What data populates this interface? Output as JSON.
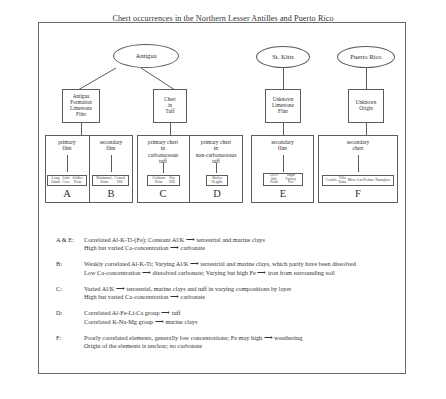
{
  "title": "Chert occurrences in the Northern Lesser Antilles and Puerto Rico",
  "islands": [
    {
      "id": "antigua",
      "label": "Antigua"
    },
    {
      "id": "st-kitts",
      "label": "St. Kitts"
    },
    {
      "id": "puerto-rico",
      "label": "Puerto Rico"
    }
  ],
  "formations": [
    {
      "id": "antigua-formation",
      "label": "Antigua\nFormation\nLimestone\nFlint"
    },
    {
      "id": "chert-in-tuff",
      "label": "Chert\nin\nTuff"
    },
    {
      "id": "unknown-limestone",
      "label": "Unknown\nLimestone\nFlint"
    },
    {
      "id": "unknown-origin",
      "label": "Unknown\nOrigin"
    }
  ],
  "categories": [
    {
      "id": "a",
      "letter": "A",
      "label": "primary\nflint",
      "sites": [
        "Long\nIsland",
        "Little\nCove",
        "Soldier\nPoint"
      ]
    },
    {
      "id": "b",
      "letter": "B",
      "label": "secondary\nflint",
      "sites": [
        "Blackman's\nPoint",
        "Corned\nHill"
      ]
    },
    {
      "id": "c",
      "letter": "C",
      "label": "primary chert\nin\ncarbonaceous\ntuff",
      "sites": [
        "Corbison\nPoint",
        "Dry\nHill"
      ]
    },
    {
      "id": "d",
      "letter": "D",
      "label": "primary chert\nin\nnon-carbonaceous\ntuff",
      "sites": [
        "Shirley\nHeights"
      ]
    },
    {
      "id": "e",
      "letter": "E",
      "label": "secondary\nflint",
      "sites": [
        "Greer\nSalt\nPond",
        "Sugar\nFactory\nPier"
      ]
    },
    {
      "id": "f",
      "letter": "F",
      "label": "secondary\nchert",
      "sites": [
        "Cerrillo",
        "Villa\nTaína",
        "Moca",
        "Las Piedras",
        "Naranjales"
      ]
    }
  ],
  "legend": [
    {
      "key": "A & E:",
      "lines": [
        "Correlated Al-K-Ti-(Fe); Constant Al/K ⟶ terrestrial and marine clays",
        "High but varied Ca-concentration ⟶ carbonate"
      ]
    },
    {
      "key": "B:",
      "lines": [
        "Weakly correlated Al-K-Ti; Varying Al/K ⟶ terrestrial and marine clays, which partly have been dissolved",
        "Low Ca-concentration ⟶ dissolved carbonate; Varying but high Fe ⟶ iron from surrounding soil"
      ]
    },
    {
      "key": "C:",
      "lines": [
        "Varied Al/K ⟶ terrestrial, marine clays and tuff in varying compositions by layer",
        "High but varied Ca-concentration ⟶ carbonate"
      ]
    },
    {
      "key": "D:",
      "lines": [
        "Correlated Al-Fe-Li-Ca group ⟶ tuff",
        "Correlated K-Na-Mg group ⟶ marine clays"
      ]
    },
    {
      "key": "F:",
      "lines": [
        "Poorly correlated elements, generally low concentrations; Fe may high ⟶ weathering",
        "Origin of the elements is unclear; no carbonate"
      ]
    }
  ]
}
